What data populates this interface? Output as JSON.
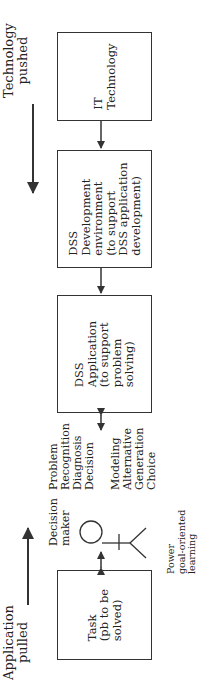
{
  "diagram": {
    "top_label": [
      "Technology",
      "pushed"
    ],
    "bottom_label": [
      "Application",
      "pulled"
    ],
    "boxes": {
      "it": [
        "IT",
        "Technology"
      ],
      "dev": [
        "DSS",
        "Development",
        "environment",
        "(to support",
        "DSS application",
        "development)"
      ],
      "app": [
        "DSS",
        "Application",
        "(to support",
        "problem",
        "solving)"
      ],
      "task": [
        "Task",
        "(pb to be",
        "solved)"
      ]
    },
    "phases_left": [
      "Problem",
      "Recognition",
      "Diagnosis",
      "Decision"
    ],
    "phases_right": [
      "Modeling",
      "Alternative",
      "Generation",
      "Choice"
    ],
    "decision_maker": [
      "Decision",
      "maker"
    ],
    "decision_maker_traits": [
      "Power",
      "goal-oriented",
      "learning"
    ],
    "colors": {
      "line": "#333333",
      "text": "#222222",
      "background": "#ffffff"
    }
  }
}
